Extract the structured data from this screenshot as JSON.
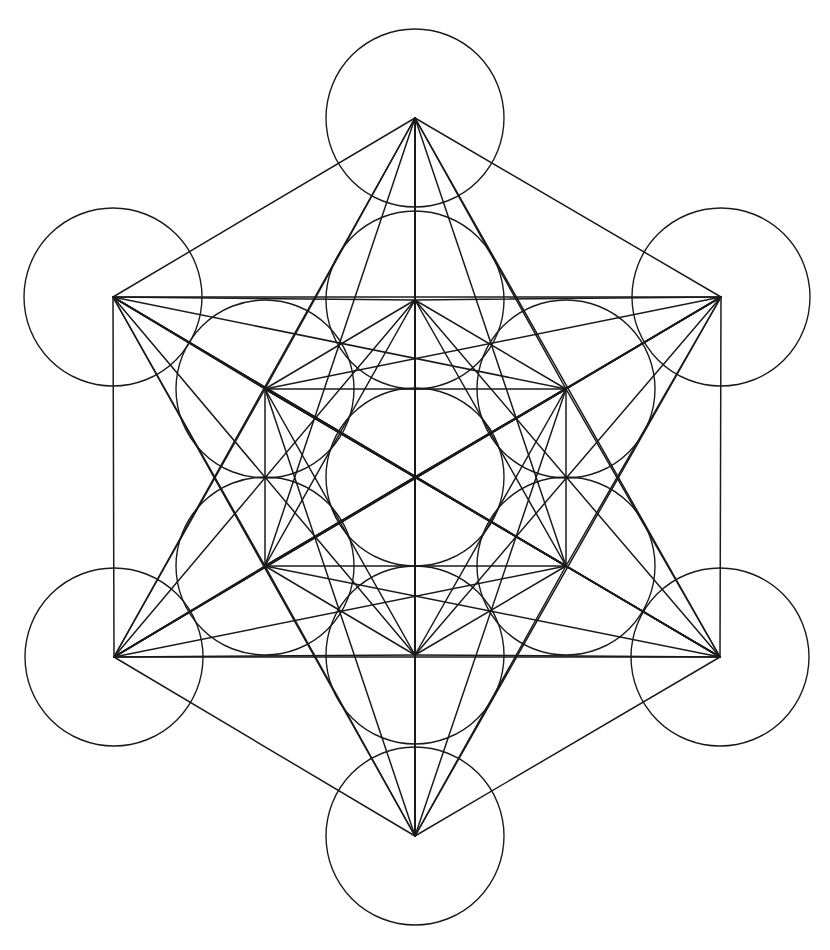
{
  "figure": {
    "subtitle": "Sacred geometry line drawing",
    "type": "geometric-line-diagram",
    "canvas": {
      "width": 830,
      "height": 950,
      "background": "#ffffff"
    },
    "stroke": {
      "color": "#1a1a1a",
      "width": 1.5,
      "circle_width": 1.4,
      "linecap": "round"
    }
  },
  "chart_data": {
    "type": "scatter",
    "xlabel": "",
    "ylabel": "",
    "xlim": [
      0,
      830
    ],
    "ylim": [
      0,
      950
    ],
    "grid": false,
    "legend": "none",
    "circle_radius": 89,
    "node_count": 13,
    "nodes": [
      {
        "id": "center",
        "label": "center",
        "x": 415,
        "y": 477,
        "ring": "center"
      },
      {
        "id": "outer-n",
        "label": "outer-top",
        "x": 415,
        "y": 118,
        "ring": "outer"
      },
      {
        "id": "outer-ne",
        "label": "outer-upper-right",
        "x": 721,
        "y": 297,
        "ring": "outer"
      },
      {
        "id": "outer-se",
        "label": "outer-lower-right",
        "x": 720,
        "y": 657,
        "ring": "outer"
      },
      {
        "id": "outer-s",
        "label": "outer-bottom",
        "x": 415,
        "y": 836,
        "ring": "outer"
      },
      {
        "id": "outer-sw",
        "label": "outer-lower-left",
        "x": 114,
        "y": 657,
        "ring": "outer"
      },
      {
        "id": "outer-nw",
        "label": "outer-upper-left",
        "x": 113,
        "y": 297,
        "ring": "outer"
      },
      {
        "id": "inner-n",
        "label": "inner-top",
        "x": 415,
        "y": 300,
        "ring": "inner"
      },
      {
        "id": "inner-ne",
        "label": "inner-upper-right",
        "x": 566,
        "y": 389,
        "ring": "inner"
      },
      {
        "id": "inner-se",
        "label": "inner-lower-right",
        "x": 566,
        "y": 566,
        "ring": "inner"
      },
      {
        "id": "inner-s",
        "label": "inner-bottom",
        "x": 415,
        "y": 655,
        "ring": "inner"
      },
      {
        "id": "inner-sw",
        "label": "inner-lower-left",
        "x": 265,
        "y": 566,
        "ring": "inner"
      },
      {
        "id": "inner-nw",
        "label": "inner-upper-left",
        "x": 265,
        "y": 389,
        "ring": "inner"
      }
    ],
    "edges": [
      [
        "outer-n",
        "outer-ne"
      ],
      [
        "outer-ne",
        "outer-se"
      ],
      [
        "outer-se",
        "outer-s"
      ],
      [
        "outer-s",
        "outer-sw"
      ],
      [
        "outer-sw",
        "outer-nw"
      ],
      [
        "outer-nw",
        "outer-n"
      ],
      [
        "outer-n",
        "outer-se"
      ],
      [
        "outer-se",
        "outer-sw"
      ],
      [
        "outer-sw",
        "outer-n"
      ],
      [
        "outer-ne",
        "outer-s"
      ],
      [
        "outer-s",
        "outer-nw"
      ],
      [
        "outer-nw",
        "outer-ne"
      ],
      [
        "outer-n",
        "outer-s"
      ],
      [
        "outer-ne",
        "outer-sw"
      ],
      [
        "outer-nw",
        "outer-se"
      ],
      [
        "inner-n",
        "inner-ne"
      ],
      [
        "inner-ne",
        "inner-se"
      ],
      [
        "inner-se",
        "inner-s"
      ],
      [
        "inner-s",
        "inner-sw"
      ],
      [
        "inner-sw",
        "inner-nw"
      ],
      [
        "inner-nw",
        "inner-n"
      ],
      [
        "inner-n",
        "inner-se"
      ],
      [
        "inner-se",
        "inner-sw"
      ],
      [
        "inner-sw",
        "inner-n"
      ],
      [
        "inner-ne",
        "inner-s"
      ],
      [
        "inner-s",
        "inner-nw"
      ],
      [
        "inner-nw",
        "inner-ne"
      ],
      [
        "inner-n",
        "inner-s"
      ],
      [
        "inner-ne",
        "inner-sw"
      ],
      [
        "inner-nw",
        "inner-se"
      ],
      [
        "center",
        "outer-n"
      ],
      [
        "center",
        "outer-ne"
      ],
      [
        "center",
        "outer-se"
      ],
      [
        "center",
        "outer-s"
      ],
      [
        "center",
        "outer-sw"
      ],
      [
        "center",
        "outer-nw"
      ],
      [
        "center",
        "inner-n"
      ],
      [
        "center",
        "inner-ne"
      ],
      [
        "center",
        "inner-se"
      ],
      [
        "center",
        "inner-s"
      ],
      [
        "center",
        "inner-sw"
      ],
      [
        "center",
        "inner-nw"
      ],
      [
        "outer-n",
        "inner-n"
      ],
      [
        "outer-n",
        "inner-ne"
      ],
      [
        "outer-n",
        "inner-nw"
      ],
      [
        "outer-n",
        "inner-se"
      ],
      [
        "outer-n",
        "inner-sw"
      ],
      [
        "outer-n",
        "inner-s"
      ],
      [
        "outer-ne",
        "inner-n"
      ],
      [
        "outer-ne",
        "inner-ne"
      ],
      [
        "outer-ne",
        "inner-se"
      ],
      [
        "outer-ne",
        "inner-nw"
      ],
      [
        "outer-ne",
        "inner-sw"
      ],
      [
        "outer-ne",
        "inner-s"
      ],
      [
        "outer-se",
        "inner-ne"
      ],
      [
        "outer-se",
        "inner-se"
      ],
      [
        "outer-se",
        "inner-s"
      ],
      [
        "outer-se",
        "inner-n"
      ],
      [
        "outer-se",
        "inner-nw"
      ],
      [
        "outer-se",
        "inner-sw"
      ],
      [
        "outer-s",
        "inner-se"
      ],
      [
        "outer-s",
        "inner-s"
      ],
      [
        "outer-s",
        "inner-sw"
      ],
      [
        "outer-s",
        "inner-ne"
      ],
      [
        "outer-s",
        "inner-nw"
      ],
      [
        "outer-s",
        "inner-n"
      ],
      [
        "outer-sw",
        "inner-s"
      ],
      [
        "outer-sw",
        "inner-sw"
      ],
      [
        "outer-sw",
        "inner-nw"
      ],
      [
        "outer-sw",
        "inner-se"
      ],
      [
        "outer-sw",
        "inner-n"
      ],
      [
        "outer-sw",
        "inner-ne"
      ],
      [
        "outer-nw",
        "inner-sw"
      ],
      [
        "outer-nw",
        "inner-nw"
      ],
      [
        "outer-nw",
        "inner-n"
      ],
      [
        "outer-nw",
        "inner-s"
      ],
      [
        "outer-nw",
        "inner-ne"
      ],
      [
        "outer-nw",
        "inner-se"
      ]
    ]
  }
}
